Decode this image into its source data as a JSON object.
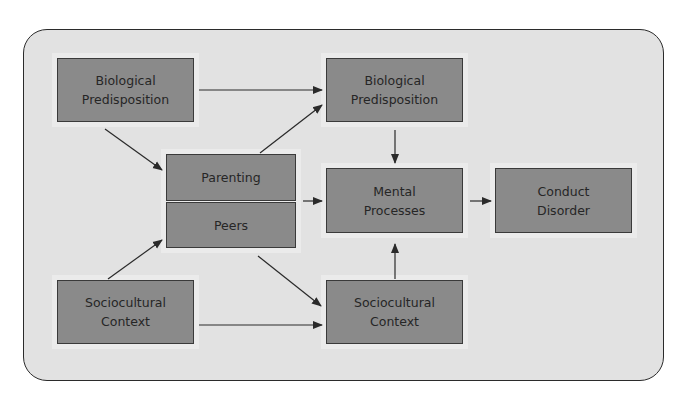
{
  "diagram": {
    "title": "",
    "colors": {
      "panel_background": "#e2e2e2",
      "panel_border": "#2b2b2b",
      "node_fill": "#8a8a8a",
      "node_border": "#3a3a3a",
      "node_text": "#262626",
      "edge": "#2a2a2a"
    },
    "nodes": [
      {
        "id": "bio_left",
        "label": "Biological\nPredisposition",
        "x": 57,
        "y": 58,
        "w": 137,
        "h": 64
      },
      {
        "id": "parenting",
        "label": "Parenting",
        "x": 166,
        "y": 154,
        "w": 130,
        "h": 47
      },
      {
        "id": "peers",
        "label": "Peers",
        "x": 166,
        "y": 202,
        "w": 130,
        "h": 46
      },
      {
        "id": "socio_left",
        "label": "Sociocultural\nContext",
        "x": 57,
        "y": 280,
        "w": 137,
        "h": 64
      },
      {
        "id": "bio_right",
        "label": "Biological\nPredisposition",
        "x": 326,
        "y": 58,
        "w": 137,
        "h": 64
      },
      {
        "id": "mental",
        "label": "Mental\nProcesses",
        "x": 326,
        "y": 168,
        "w": 137,
        "h": 65
      },
      {
        "id": "socio_right",
        "label": "Sociocultural\nContext",
        "x": 326,
        "y": 280,
        "w": 137,
        "h": 64
      },
      {
        "id": "conduct",
        "label": "Conduct\nDisorder",
        "x": 495,
        "y": 168,
        "w": 137,
        "h": 65
      }
    ],
    "edges": [
      {
        "from": "bio_left",
        "to": "bio_right",
        "x1": 199,
        "y1": 90,
        "x2": 322,
        "y2": 90
      },
      {
        "from": "bio_left",
        "to": "parenting",
        "x1": 105,
        "y1": 129,
        "x2": 162,
        "y2": 170
      },
      {
        "from": "parenting",
        "to": "bio_right",
        "x1": 260,
        "y1": 153,
        "x2": 322,
        "y2": 105
      },
      {
        "from": "socio_left",
        "to": "peers",
        "x1": 108,
        "y1": 279,
        "x2": 162,
        "y2": 240
      },
      {
        "from": "peers",
        "to": "socio_right",
        "x1": 258,
        "y1": 256,
        "x2": 321,
        "y2": 306
      },
      {
        "from": "socio_left",
        "to": "socio_right",
        "x1": 199,
        "y1": 325,
        "x2": 322,
        "y2": 325
      },
      {
        "from": "parenting_peers",
        "to": "mental",
        "x1": 303,
        "y1": 201,
        "x2": 322,
        "y2": 201
      },
      {
        "from": "bio_right",
        "to": "mental",
        "x1": 395,
        "y1": 130,
        "x2": 395,
        "y2": 163
      },
      {
        "from": "socio_right",
        "to": "mental",
        "x1": 395,
        "y1": 279,
        "x2": 395,
        "y2": 244
      },
      {
        "from": "mental",
        "to": "conduct",
        "x1": 470,
        "y1": 201,
        "x2": 491,
        "y2": 201
      }
    ]
  }
}
